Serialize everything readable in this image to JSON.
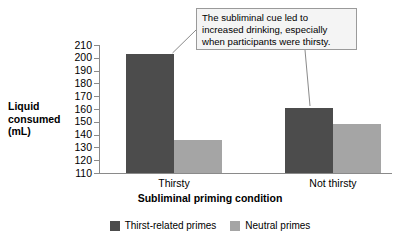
{
  "chart_data": {
    "type": "bar",
    "title": "",
    "xlabel": "Subliminal priming condition",
    "ylabel": "Liquid consumed (mL)",
    "ylabel_lines": [
      "Liquid",
      "consumed",
      "(mL)"
    ],
    "categories": [
      "Thirsty",
      "Not thirsty"
    ],
    "series": [
      {
        "name": "Thirst-related primes",
        "color": "#4c4c4c",
        "values": [
          203,
          161
        ]
      },
      {
        "name": "Neutral primes",
        "color": "#a5a5a5",
        "values": [
          136,
          148
        ]
      }
    ],
    "ylim": [
      110,
      210
    ],
    "yticks": [
      210,
      200,
      190,
      180,
      170,
      160,
      150,
      140,
      130,
      120,
      110
    ],
    "grid": false,
    "legend_position": "bottom",
    "annotations": [
      {
        "text": "The subliminal cue led to increased drinking, especially when participants were thirsty.",
        "lines": [
          "The subliminal cue led to",
          "increased drinking, especially",
          "when participants were thirsty."
        ],
        "points_to": [
          "Thirsty / Thirst-related primes",
          "Not thirsty / Thirst-related primes"
        ]
      }
    ]
  },
  "colors": {
    "dark_series": "#4c4c4c",
    "light_series": "#a5a5a5",
    "axis": "#8a8a8a",
    "callout_bg": "#f4f4f4",
    "callout_border": "#9a9a9a"
  }
}
